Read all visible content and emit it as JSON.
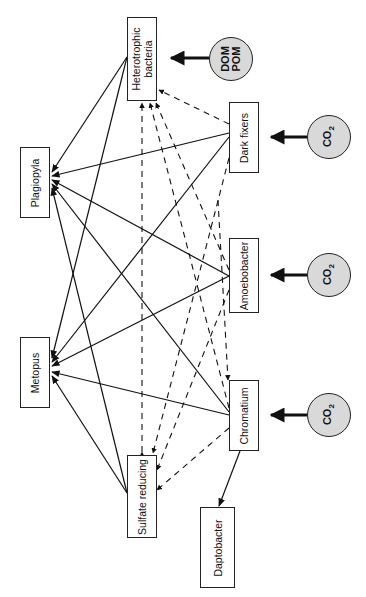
{
  "diagram": {
    "nodes": {
      "heterotrophic": {
        "line1": "Heterotrophic",
        "line2": "bacteria"
      },
      "plagiopyla": {
        "label": "Plagiopyla"
      },
      "metopus": {
        "label": "Metopus"
      },
      "dark_fixers": {
        "label": "Dark fixers"
      },
      "amoebobacter": {
        "label": "Amoebobacter"
      },
      "chromatium": {
        "label": "Chromatium"
      },
      "sulfate_reducing": {
        "label": "Sulfate reducing"
      },
      "daptobacter": {
        "label": "Daptobacter"
      }
    },
    "sources": {
      "dom_pom": {
        "line1": "DOM",
        "line2": "POM"
      },
      "co2_dark_fixers": {
        "base": "CO",
        "sub": "2"
      },
      "co2_amoebobacter": {
        "base": "CO",
        "sub": "2"
      },
      "co2_chromatium": {
        "base": "CO",
        "sub": "2"
      }
    },
    "edges_solid": [
      [
        "Heterotrophic bacteria",
        "Plagiopyla"
      ],
      [
        "Heterotrophic bacteria",
        "Metopus"
      ],
      [
        "Dark fixers",
        "Plagiopyla"
      ],
      [
        "Dark fixers",
        "Metopus"
      ],
      [
        "Amoebobacter",
        "Plagiopyla"
      ],
      [
        "Amoebobacter",
        "Metopus"
      ],
      [
        "Chromatium",
        "Plagiopyla"
      ],
      [
        "Chromatium",
        "Metopus"
      ],
      [
        "Chromatium",
        "Daptobacter"
      ],
      [
        "Sulfate reducing",
        "Plagiopyla"
      ],
      [
        "Sulfate reducing",
        "Metopus"
      ]
    ],
    "edges_dashed": [
      [
        "Dark fixers",
        "Heterotrophic bacteria"
      ],
      [
        "Amoebobacter",
        "Heterotrophic bacteria"
      ],
      [
        "Chromatium",
        "Heterotrophic bacteria"
      ],
      [
        "Sulfate reducing",
        "Heterotrophic bacteria"
      ],
      [
        "Heterotrophic bacteria",
        "Sulfate reducing"
      ],
      [
        "Dark fixers",
        "Sulfate reducing"
      ],
      [
        "Amoebobacter",
        "Sulfate reducing"
      ],
      [
        "Chromatium",
        "Sulfate reducing"
      ],
      [
        "Amoebobacter",
        "Chromatium"
      ]
    ],
    "input_arrows": [
      [
        "DOM POM",
        "Heterotrophic bacteria"
      ],
      [
        "CO2",
        "Dark fixers"
      ],
      [
        "CO2",
        "Amoebobacter"
      ],
      [
        "CO2",
        "Chromatium"
      ]
    ]
  }
}
